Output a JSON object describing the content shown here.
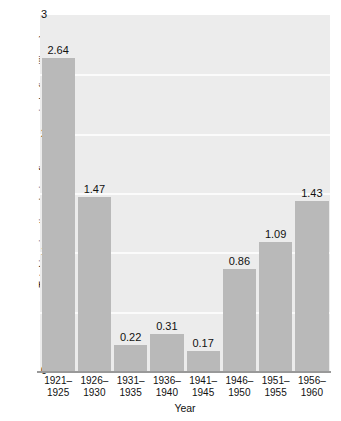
{
  "chart_data": {
    "type": "bar",
    "title": "",
    "xlabel": "Year",
    "ylabel": "Total immigration during five-year periods (in millions)",
    "categories": [
      "1921–\n1925",
      "1926–\n1930",
      "1931–\n1935",
      "1936–\n1940",
      "1941–\n1945",
      "1946–\n1950",
      "1951–\n1955",
      "1956–\n1960"
    ],
    "category_lines": [
      [
        "1921–",
        "1925"
      ],
      [
        "1926–",
        "1930"
      ],
      [
        "1931–",
        "1935"
      ],
      [
        "1936–",
        "1940"
      ],
      [
        "1941–",
        "1945"
      ],
      [
        "1946–",
        "1950"
      ],
      [
        "1951–",
        "1955"
      ],
      [
        "1956–",
        "1960"
      ]
    ],
    "values": [
      2.64,
      1.47,
      0.22,
      0.31,
      0.17,
      0.86,
      1.09,
      1.43
    ],
    "value_labels": [
      "2.64",
      "1.47",
      "0.22",
      "0.31",
      "0.17",
      "0.86",
      "1.09",
      "1.43"
    ],
    "ylim": [
      0,
      3
    ],
    "ytick_labels": [
      "3",
      "2",
      "1",
      "0"
    ],
    "ytick_values": [
      3,
      2,
      1,
      0
    ],
    "gridlines": [
      0.5,
      1.0,
      1.5,
      2.0,
      2.5
    ],
    "grid": true,
    "legend": null,
    "colors": {
      "bar": "#b9b9b9",
      "plot_background": "#ececec",
      "gridline": "#fbfbfb",
      "axis": "#999999",
      "text": "#111111",
      "page_background": "#ffffff"
    }
  }
}
